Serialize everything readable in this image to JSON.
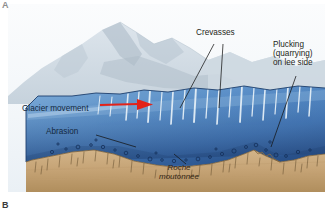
{
  "figure": {
    "panel_top_letter": "A",
    "panel_bottom_letter": "B",
    "type": "illustration"
  },
  "labels": {
    "crevasses": "Crevasses",
    "plucking_line1": "Plucking",
    "plucking_line2": "(quarrying)",
    "plucking_line3": "on lee side",
    "glacier_movement": "Glacier movement",
    "abrasion": "Abrasion",
    "roche_line1": "Roche",
    "roche_line2": "moutonnée"
  },
  "colors": {
    "sky": "#f4f7fa",
    "mountain_far": "#d6dee6",
    "mountain_mid": "#c3cfd9",
    "mountain_shadow": "#a8b6c2",
    "ice_top": "#6f9fd0",
    "ice_mid": "#4f86c2",
    "ice_deep": "#2f5f9e",
    "ice_basal": "#27497e",
    "bedrock": "#c9a97a",
    "bedrock_dark": "#b2905f",
    "striation": "#6b5434",
    "arrow_red": "#e32219",
    "leader_line": "#1a1a1a",
    "clast": "#1b3a6b"
  }
}
